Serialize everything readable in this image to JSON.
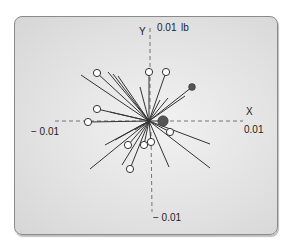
{
  "diagram": {
    "type": "vector-polar-plot",
    "units": "lb",
    "axes": {
      "x_label": "X",
      "y_label": "Y",
      "x_pos_tick": "0.01",
      "x_neg_tick": "− 0.01",
      "y_pos_tick": "0.01",
      "y_neg_tick": "− 0.01",
      "unit_label": "lb"
    },
    "colors": {
      "panel_bg": "#e3e3e3",
      "vector_line": "#333333",
      "axis_dash": "#555555",
      "open_marker_fill": "#ffffff",
      "filled_marker": "#555555"
    },
    "origin_px": [
      149,
      121
    ],
    "scale_px_per_unit": 6000,
    "vectors": [
      {
        "end": [
          81,
          75
        ],
        "marker": "none"
      },
      {
        "end": [
          97,
          73
        ],
        "marker": "open"
      },
      {
        "end": [
          108,
          72
        ],
        "marker": "none"
      },
      {
        "end": [
          113,
          74
        ],
        "marker": "none"
      },
      {
        "end": [
          118,
          76
        ],
        "marker": "none"
      },
      {
        "end": [
          140,
          87
        ],
        "marker": "none"
      },
      {
        "end": [
          149,
          72
        ],
        "marker": "open"
      },
      {
        "end": [
          166,
          72
        ],
        "marker": "open"
      },
      {
        "end": [
          160,
          100
        ],
        "marker": "none"
      },
      {
        "end": [
          168,
          98
        ],
        "marker": "none"
      },
      {
        "end": [
          192,
          87
        ],
        "marker": "filled-small"
      },
      {
        "end": [
          185,
          96
        ],
        "marker": "none"
      },
      {
        "end": [
          97,
          109
        ],
        "marker": "open"
      },
      {
        "end": [
          110,
          112
        ],
        "marker": "none"
      },
      {
        "end": [
          88,
          122
        ],
        "marker": "open"
      },
      {
        "end": [
          163,
          121
        ],
        "marker": "filled-large"
      },
      {
        "end": [
          170,
          132
        ],
        "marker": "open"
      },
      {
        "end": [
          210,
          144
        ],
        "marker": "none"
      },
      {
        "end": [
          210,
          168
        ],
        "marker": "none"
      },
      {
        "end": [
          169,
          167
        ],
        "marker": "none"
      },
      {
        "end": [
          151,
          142
        ],
        "marker": "open"
      },
      {
        "end": [
          144,
          145
        ],
        "marker": "open"
      },
      {
        "end": [
          128,
          145
        ],
        "marker": "open"
      },
      {
        "end": [
          130,
          169
        ],
        "marker": "open"
      },
      {
        "end": [
          122,
          165
        ],
        "marker": "none"
      },
      {
        "end": [
          90,
          169
        ],
        "marker": "none"
      },
      {
        "end": [
          105,
          145
        ],
        "marker": "none"
      },
      {
        "end": [
          115,
          140
        ],
        "marker": "none"
      },
      {
        "end": [
          135,
          130
        ],
        "marker": "none"
      }
    ]
  }
}
